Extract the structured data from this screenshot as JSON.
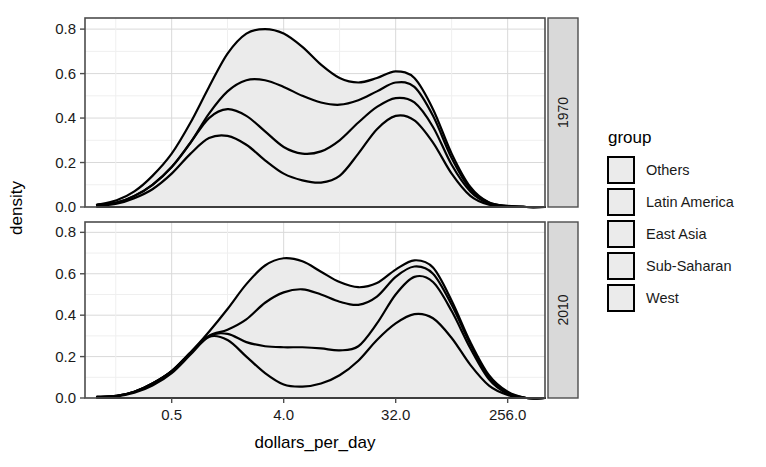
{
  "chart_data": {
    "type": "area",
    "title": "",
    "subtitle": "",
    "xlabel": "dollars_per_day",
    "ylabel": "density",
    "grid": true,
    "stacked": true,
    "x_scale": "log2",
    "xlim": [
      0.1,
      512
    ],
    "ylim": [
      0.0,
      0.85
    ],
    "x_ticks": [
      "0.5",
      "4.0",
      "32.0",
      "256.0"
    ],
    "x_tick_values": [
      0.5,
      4.0,
      32.0,
      256.0
    ],
    "y_ticks": [
      "0.0",
      "0.2",
      "0.4",
      "0.6",
      "0.8"
    ],
    "y_tick_values": [
      0.0,
      0.2,
      0.4,
      0.6,
      0.8
    ],
    "facet_var": "year",
    "facets": [
      "1970",
      "2010"
    ],
    "legend": {
      "title": "group",
      "position": "right",
      "entries": [
        "Others",
        "Latin America",
        "East Asia",
        "Sub-Saharan",
        "West"
      ],
      "key_fill": "#ebebeb",
      "key_stroke": "#000000"
    },
    "panels": [
      {
        "facet": "1970",
        "x": [
          0.125,
          0.18,
          0.25,
          0.35,
          0.5,
          0.71,
          1.0,
          1.41,
          2.0,
          2.83,
          4.0,
          5.66,
          8.0,
          11.3,
          16.0,
          22.6,
          32.0,
          45.3,
          64.0,
          90.5,
          128.0,
          181.0,
          256.0,
          362.0,
          512.0
        ],
        "series": [
          {
            "name": "cumulative-top",
            "label": "Others (stack top)",
            "values": [
              0.01,
              0.03,
              0.07,
              0.14,
              0.24,
              0.38,
              0.54,
              0.69,
              0.78,
              0.8,
              0.78,
              0.72,
              0.64,
              0.58,
              0.56,
              0.58,
              0.61,
              0.58,
              0.44,
              0.24,
              0.09,
              0.02,
              0.005,
              0.0,
              0.0
            ]
          },
          {
            "name": "cumulative-2",
            "label": "Latin America (stack)",
            "values": [
              0.01,
              0.02,
              0.05,
              0.1,
              0.18,
              0.29,
              0.42,
              0.52,
              0.57,
              0.57,
              0.54,
              0.5,
              0.47,
              0.46,
              0.48,
              0.52,
              0.56,
              0.54,
              0.41,
              0.22,
              0.08,
              0.02,
              0.004,
              0.0,
              0.0
            ]
          },
          {
            "name": "cumulative-3",
            "label": "East Asia (stack)",
            "values": [
              0.01,
              0.02,
              0.05,
              0.1,
              0.18,
              0.29,
              0.4,
              0.44,
              0.41,
              0.34,
              0.27,
              0.24,
              0.25,
              0.3,
              0.38,
              0.45,
              0.49,
              0.47,
              0.36,
              0.19,
              0.07,
              0.015,
              0.003,
              0.0,
              0.0
            ]
          },
          {
            "name": "cumulative-4",
            "label": "Sub-Saharan (stack)",
            "values": [
              0.005,
              0.015,
              0.04,
              0.08,
              0.15,
              0.24,
              0.31,
              0.32,
              0.28,
              0.21,
              0.15,
              0.12,
              0.11,
              0.14,
              0.24,
              0.35,
              0.41,
              0.39,
              0.29,
              0.15,
              0.05,
              0.01,
              0.002,
              0.0,
              0.0
            ]
          },
          {
            "name": "cumulative-5",
            "label": "West (stack, near zero)",
            "values": [
              0.0,
              0.0,
              0.0,
              0.0,
              0.0,
              0.0,
              0.0,
              0.0,
              0.0,
              0.0,
              0.0,
              0.0,
              0.0,
              0.0,
              0.0,
              0.0,
              0.0,
              0.0,
              0.0,
              0.0,
              0.0,
              0.0,
              0.0,
              0.0,
              0.0
            ]
          }
        ],
        "peaks": [
          {
            "series": "cumulative-top",
            "x": 2.6,
            "y": 0.8
          },
          {
            "series": "cumulative-top",
            "x": 31.0,
            "y": 0.61
          },
          {
            "series": "cumulative-2",
            "x": 2.3,
            "y": 0.575
          },
          {
            "series": "cumulative-2",
            "x": 30.0,
            "y": 0.555
          },
          {
            "series": "cumulative-3",
            "x": 1.35,
            "y": 0.445
          },
          {
            "series": "cumulative-3",
            "x": 31.0,
            "y": 0.49
          },
          {
            "series": "cumulative-4",
            "x": 1.2,
            "y": 0.32
          },
          {
            "series": "cumulative-4",
            "x": 32.0,
            "y": 0.405
          }
        ]
      },
      {
        "facet": "2010",
        "x": [
          0.125,
          0.18,
          0.25,
          0.35,
          0.5,
          0.71,
          1.0,
          1.41,
          2.0,
          2.83,
          4.0,
          5.66,
          8.0,
          11.3,
          16.0,
          22.6,
          32.0,
          45.3,
          64.0,
          90.5,
          128.0,
          181.0,
          256.0,
          362.0,
          512.0
        ],
        "series": [
          {
            "name": "cumulative-top",
            "label": "Others (stack top)",
            "values": [
              0.005,
              0.01,
              0.03,
              0.07,
              0.13,
              0.22,
              0.32,
              0.43,
              0.55,
              0.64,
              0.675,
              0.66,
              0.61,
              0.56,
              0.535,
              0.555,
              0.62,
              0.665,
              0.63,
              0.47,
              0.27,
              0.11,
              0.03,
              0.0,
              0.0
            ]
          },
          {
            "name": "cumulative-2",
            "label": "Latin America (stack)",
            "values": [
              0.005,
              0.01,
              0.03,
              0.07,
              0.13,
              0.22,
              0.3,
              0.33,
              0.38,
              0.46,
              0.51,
              0.525,
              0.5,
              0.465,
              0.45,
              0.49,
              0.585,
              0.635,
              0.6,
              0.45,
              0.26,
              0.1,
              0.025,
              0.0,
              0.0
            ]
          },
          {
            "name": "cumulative-3",
            "label": "East Asia (stack)",
            "values": [
              0.005,
              0.01,
              0.03,
              0.07,
              0.13,
              0.22,
              0.3,
              0.31,
              0.27,
              0.25,
              0.245,
              0.245,
              0.24,
              0.23,
              0.25,
              0.36,
              0.5,
              0.585,
              0.56,
              0.42,
              0.24,
              0.09,
              0.02,
              0.0,
              0.0
            ]
          },
          {
            "name": "cumulative-4",
            "label": "Sub-Saharan (stack)",
            "values": [
              0.003,
              0.008,
              0.025,
              0.06,
              0.12,
              0.21,
              0.295,
              0.28,
              0.2,
              0.12,
              0.065,
              0.055,
              0.07,
              0.11,
              0.18,
              0.28,
              0.36,
              0.405,
              0.385,
              0.29,
              0.16,
              0.06,
              0.015,
              0.0,
              0.0
            ]
          },
          {
            "name": "cumulative-5",
            "label": "West (stack, near zero)",
            "values": [
              0.0,
              0.0,
              0.0,
              0.0,
              0.0,
              0.0,
              0.0,
              0.0,
              0.0,
              0.0,
              0.0,
              0.0,
              0.0,
              0.0,
              0.0,
              0.0,
              0.0,
              0.0,
              0.0,
              0.0,
              0.0,
              0.0,
              0.0,
              0.0,
              0.0
            ]
          }
        ],
        "peaks": [
          {
            "series": "cumulative-top",
            "x": 5.0,
            "y": 0.675
          },
          {
            "series": "cumulative-top",
            "x": 48.0,
            "y": 0.665
          },
          {
            "series": "cumulative-2",
            "x": 6.5,
            "y": 0.525
          },
          {
            "series": "cumulative-2",
            "x": 48.0,
            "y": 0.635
          },
          {
            "series": "cumulative-3",
            "x": 48.0,
            "y": 0.585
          },
          {
            "series": "cumulative-4",
            "x": 0.95,
            "y": 0.3
          },
          {
            "series": "cumulative-4",
            "x": 48.0,
            "y": 0.405
          }
        ]
      }
    ],
    "style": {
      "area_fill": "#ebebeb",
      "line_color": "#000000",
      "panel_background": "#ffffff",
      "grid_color": "#d9d9d9",
      "strip_background": "#d9d9d9",
      "panel_border": "#4d4d4d"
    }
  }
}
